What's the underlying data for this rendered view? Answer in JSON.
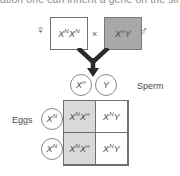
{
  "page": {
    "top_cut_text": "ation one can inherit a gene on the single",
    "background": "#ffffff"
  },
  "colors": {
    "male_box_fill": "#a8a8a8",
    "female_box_fill": "#ffffff",
    "shaded_cell_fill": "#d9d9d9",
    "plain_cell_fill": "#ffffff",
    "stroke": "#6f6f6f",
    "text": "#4a4a4a"
  },
  "cross": {
    "female": {
      "symbol": "♀",
      "symbol_name": "female-symbol",
      "genotype_base1": "X",
      "genotype_sup1": "N",
      "genotype_base2": "X",
      "genotype_sup2": "N",
      "genotype_text": "XᴺXᴺ",
      "fill": "#ffffff"
    },
    "operator": "×",
    "male": {
      "symbol": "♂",
      "symbol_name": "male-symbol",
      "genotype_base1": "X",
      "genotype_sup1": "n",
      "genotype_base2": "Y",
      "genotype_sup2": "",
      "genotype_text": "XⁿY",
      "fill": "#a8a8a8"
    }
  },
  "arrow": {
    "name": "converging-down-arrow",
    "description": "two lines converging into a single downward arrow"
  },
  "gametes": {
    "sperm_label": "Sperm",
    "eggs_label": "Eggs",
    "sperm": [
      {
        "base": "X",
        "sup": "n",
        "text": "Xⁿ"
      },
      {
        "base": "Y",
        "sup": "",
        "text": "Y"
      }
    ],
    "eggs": [
      {
        "base": "X",
        "sup": "N",
        "text": "Xᴺ"
      },
      {
        "base": "X",
        "sup": "N",
        "text": "Xᴺ"
      }
    ]
  },
  "punnett": {
    "rows": [
      {
        "cells": [
          {
            "base1": "X",
            "sup1": "N",
            "base2": "X",
            "sup2": "n",
            "text": "XᴺXⁿ",
            "shaded": true
          },
          {
            "base1": "X",
            "sup1": "N",
            "base2": "Y",
            "sup2": "",
            "text": "XᴺY",
            "shaded": false
          }
        ]
      },
      {
        "cells": [
          {
            "base1": "X",
            "sup1": "N",
            "base2": "X",
            "sup2": "n",
            "text": "XᴺXⁿ",
            "shaded": true
          },
          {
            "base1": "X",
            "sup1": "N",
            "base2": "Y",
            "sup2": "",
            "text": "XᴺY",
            "shaded": false
          }
        ]
      }
    ]
  }
}
